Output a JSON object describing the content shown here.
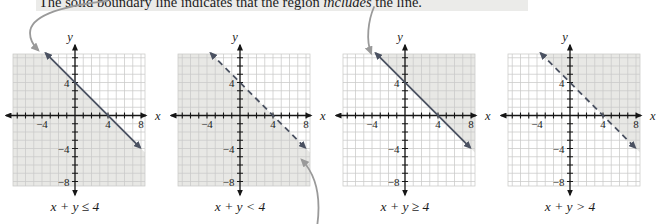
{
  "caption": {
    "before": "The solid boundary line indicates that the region ",
    "emphasis": "includes",
    "after": " the line."
  },
  "colors": {
    "boundary_line": "#4a5161",
    "axis": "#161616",
    "grid_line": "#c9cac8",
    "shading": "#e8e8e5",
    "annotation_arrow": "#9a9a9a",
    "text": "#1c1c1c"
  },
  "graphs": [
    {
      "label": "x + y ≤ 4",
      "boundary_style": "solid",
      "shaded_region": "below-line",
      "x_axis_label": "x",
      "y_axis_label": "y",
      "x_tick_labels": [
        {
          "value": -4,
          "text": "−4"
        },
        {
          "value": 4,
          "text": "4"
        },
        {
          "value": 8,
          "text": "8"
        }
      ],
      "y_tick_labels": [
        {
          "value": 4,
          "text": "4"
        },
        {
          "value": -4,
          "text": "−4"
        },
        {
          "value": -8,
          "text": "−8"
        }
      ],
      "line": {
        "equation": "x + y = 4",
        "slope": -1,
        "x_intercept": 4,
        "y_intercept": 4
      }
    },
    {
      "label": "x + y < 4",
      "boundary_style": "dashed",
      "shaded_region": "below-line",
      "x_axis_label": "x",
      "y_axis_label": "y",
      "x_tick_labels": [
        {
          "value": -4,
          "text": "−4"
        },
        {
          "value": 4,
          "text": "4"
        },
        {
          "value": 8,
          "text": "8"
        }
      ],
      "y_tick_labels": [
        {
          "value": 4,
          "text": "4"
        },
        {
          "value": -4,
          "text": "−4"
        },
        {
          "value": -8,
          "text": "−8"
        }
      ],
      "line": {
        "equation": "x + y = 4",
        "slope": -1,
        "x_intercept": 4,
        "y_intercept": 4
      }
    },
    {
      "label": "x + y ≥ 4",
      "boundary_style": "solid",
      "shaded_region": "above-line",
      "x_axis_label": "x",
      "y_axis_label": "y",
      "x_tick_labels": [
        {
          "value": -4,
          "text": "−4"
        },
        {
          "value": 4,
          "text": "4"
        },
        {
          "value": 8,
          "text": "8"
        }
      ],
      "y_tick_labels": [
        {
          "value": 4,
          "text": "4"
        },
        {
          "value": -4,
          "text": "−4"
        },
        {
          "value": -8,
          "text": "−8"
        }
      ],
      "line": {
        "equation": "x + y = 4",
        "slope": -1,
        "x_intercept": 4,
        "y_intercept": 4
      }
    },
    {
      "label": "x + y > 4",
      "boundary_style": "dashed",
      "shaded_region": "above-line",
      "x_axis_label": "x",
      "y_axis_label": "y",
      "x_tick_labels": [
        {
          "value": -4,
          "text": "−4"
        },
        {
          "value": 4,
          "text": "4"
        },
        {
          "value": 8,
          "text": "8"
        }
      ],
      "y_tick_labels": [
        {
          "value": 4,
          "text": "4"
        },
        {
          "value": -4,
          "text": "−4"
        },
        {
          "value": -8,
          "text": "−8"
        }
      ],
      "line": {
        "equation": "x + y = 4",
        "slope": -1,
        "x_intercept": 4,
        "y_intercept": 4
      }
    }
  ],
  "annotation_arrows": [
    {
      "points_to": "solid boundary line of first graph",
      "from": "caption"
    },
    {
      "points_to": "dashed boundary line of second graph",
      "from": "below figure"
    },
    {
      "points_to": "solid boundary line of third graph",
      "from": "above figure"
    }
  ]
}
